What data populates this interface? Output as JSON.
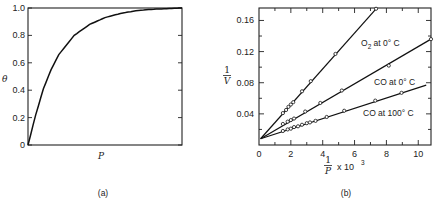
{
  "chart_data": [
    {
      "type": "line",
      "panel": "(a)",
      "title": "",
      "xlabel": "P",
      "ylabel": "θ",
      "ylim": [
        0,
        1.0
      ],
      "yticks": [
        "0",
        "0.2",
        "0.4",
        "0.6",
        "0.8",
        "1.0"
      ],
      "xticks": [],
      "grid": false,
      "series": [
        {
          "name": "Langmuir isotherm",
          "x": [
            0,
            0.05,
            0.1,
            0.15,
            0.2,
            0.3,
            0.4,
            0.5,
            0.6,
            0.7,
            0.8,
            0.9,
            1.0
          ],
          "y": [
            0,
            0.22,
            0.41,
            0.55,
            0.66,
            0.8,
            0.88,
            0.93,
            0.96,
            0.98,
            0.99,
            0.995,
            1.0
          ]
        }
      ]
    },
    {
      "type": "scatter",
      "panel": "(b)",
      "title": "",
      "xlabel": "1/P x 10^3",
      "xlabel_num": "1",
      "xlabel_den": "P",
      "xlabel_suffix": "x 10",
      "xlabel_exp": "3",
      "ylabel": "1/V",
      "ylabel_num": "1",
      "ylabel_den": "V",
      "xlim": [
        0,
        10.8
      ],
      "ylim": [
        0,
        0.176
      ],
      "xticks": [
        "0",
        "2",
        "4",
        "6",
        "8",
        "10"
      ],
      "yticks": [
        "0.04",
        "0.08",
        "0.12",
        "0.16"
      ],
      "grid": false,
      "series": [
        {
          "name": "O2 at 0° C",
          "label_main": "O",
          "label_sub": "2",
          "label_rest": " at 0° C",
          "intercept": 0.008,
          "line_end": [
            7.35,
            0.175
          ],
          "x": [
            1.5,
            1.7,
            1.85,
            2.0,
            2.15,
            2.7,
            3.25,
            4.8,
            7.35
          ],
          "y": [
            0.041,
            0.045,
            0.049,
            0.052,
            0.055,
            0.069,
            0.082,
            0.117,
            0.175
          ]
        },
        {
          "name": "CO at 0° C",
          "label": "CO at 0° C",
          "intercept": 0.008,
          "line_end": [
            10.8,
            0.136
          ],
          "x": [
            1.5,
            1.8,
            2.0,
            2.2,
            2.9,
            3.85,
            5.2,
            8.15,
            10.8
          ],
          "y": [
            0.027,
            0.03,
            0.032,
            0.034,
            0.043,
            0.054,
            0.07,
            0.102,
            0.136
          ]
        },
        {
          "name": "CO at 100° C",
          "label": "CO at 100° C",
          "intercept": 0.008,
          "line_end": [
            10.5,
            0.077
          ],
          "x": [
            1.5,
            1.8,
            2.0,
            2.2,
            2.45,
            2.7,
            3.0,
            3.2,
            3.55,
            4.25,
            5.35,
            7.3,
            8.95
          ],
          "y": [
            0.018,
            0.02,
            0.021,
            0.023,
            0.024,
            0.026,
            0.028,
            0.029,
            0.031,
            0.036,
            0.044,
            0.057,
            0.067
          ]
        }
      ]
    }
  ]
}
